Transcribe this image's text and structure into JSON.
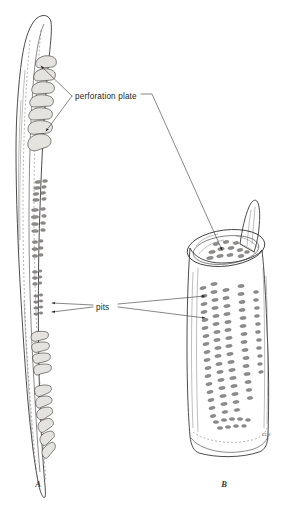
{
  "figure": {
    "background_color": "#ffffff",
    "ink_color": "#2e2c2b",
    "body_fill": "#e8e8e6",
    "pit_color": "#8e8c8a"
  },
  "labels": {
    "perforation_plate": "perforation plate",
    "pits": "pits"
  },
  "captions": {
    "panel_a": "A",
    "panel_b": "B"
  },
  "signature": {
    "mark": "ELW"
  },
  "panels": [
    {
      "id": "A",
      "caption": "A",
      "description": "Elongated narrow vessel element with tapering ends, scalariform perforation plates at the upper and lower ends and rows of pits along the wall",
      "annotations": [
        "perforation plate",
        "pits"
      ]
    },
    {
      "id": "B",
      "caption": "B",
      "description": "Short wide barrel-shaped vessel element with an open elliptical perforation plate at the top, a horn-like tail projection, and dense vertical columns of elliptical pits over the wall",
      "annotations": [
        "perforation plate",
        "pits"
      ]
    }
  ],
  "leaders": {
    "perforation_plate_targets": 3,
    "pits_targets": 4
  }
}
